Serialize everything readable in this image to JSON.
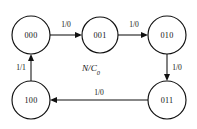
{
  "diagram": {
    "type": "state-transition-diagram",
    "center_annotation": {
      "base": "N/C",
      "subscript": "0",
      "full": "N/C0"
    },
    "states": [
      {
        "id": "s000",
        "label": "000",
        "cx": 31,
        "cy": 35,
        "r": 19
      },
      {
        "id": "s001",
        "label": "001",
        "cx": 100,
        "cy": 35,
        "r": 18
      },
      {
        "id": "s010",
        "label": "010",
        "cx": 167,
        "cy": 35,
        "r": 19
      },
      {
        "id": "s011",
        "label": "011",
        "cx": 167,
        "cy": 100,
        "r": 19
      },
      {
        "id": "s100",
        "label": "100",
        "cx": 31,
        "cy": 100,
        "r": 19
      }
    ],
    "transitions": [
      {
        "id": "t1",
        "from": "000",
        "to": "001",
        "label": "1/0",
        "label_x": 66,
        "label_y": 24
      },
      {
        "id": "t2",
        "from": "001",
        "to": "010",
        "label": "1/0",
        "label_x": 134,
        "label_y": 24
      },
      {
        "id": "t3",
        "from": "010",
        "to": "011",
        "label": "1/0",
        "label_x": 177,
        "label_y": 67
      },
      {
        "id": "t4",
        "from": "011",
        "to": "100",
        "label": "1/0",
        "label_x": 99,
        "label_y": 92
      },
      {
        "id": "t5",
        "from": "100",
        "to": "000",
        "label": "1/1",
        "label_x": 21,
        "label_y": 67
      }
    ],
    "colors": {
      "background": "#ffffff",
      "stroke": "#111111",
      "text": "#111111"
    }
  }
}
